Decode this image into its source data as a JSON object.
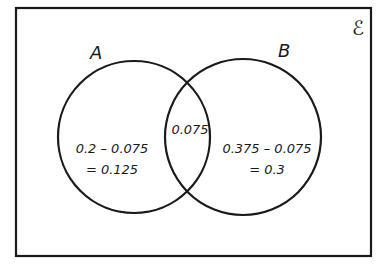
{
  "diagram": {
    "type": "venn",
    "universal_label": "ℰ",
    "sets": [
      {
        "name": "A",
        "label": "A"
      },
      {
        "name": "B",
        "label": "B"
      }
    ],
    "regions": {
      "a_only": {
        "line1": "0.2 – 0.075",
        "line2": "= 0.125"
      },
      "intersection": {
        "line1": "0.075"
      },
      "b_only": {
        "line1": "0.375 – 0.075",
        "line2": "= 0.3"
      }
    },
    "colors": {
      "stroke": "#1a1a1a",
      "background": "#ffffff"
    }
  }
}
